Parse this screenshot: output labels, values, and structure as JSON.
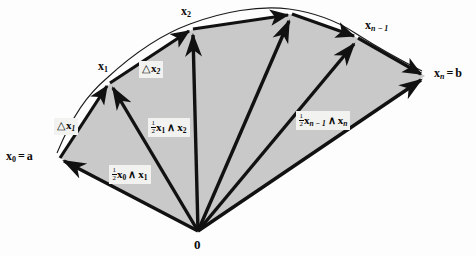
{
  "figure": {
    "name": "wedge-product-fan-diagram",
    "background_color": "#fdfdfd",
    "fill_color": "#c9c9c9",
    "stroke_color": "#111111",
    "curve_color": "#1a1a1a"
  },
  "labels": {
    "origin": "0",
    "start_point": {
      "vec": "x",
      "sub": "0",
      "eq": "=",
      "value": "a"
    },
    "end_point": {
      "vec": "x",
      "sub": "n",
      "eq": "=",
      "value": "b"
    },
    "x1": {
      "vec": "x",
      "sub": "1"
    },
    "x2": {
      "vec": "x",
      "sub": "2"
    },
    "xn1": {
      "vec": "x",
      "sub": "n − 1"
    }
  },
  "annotations": [
    {
      "name": "delta-x1",
      "triangle": "△",
      "vec": "x",
      "sub": "1",
      "text": "△x1"
    },
    {
      "name": "delta-x2",
      "triangle": "△",
      "vec": "x",
      "sub": "2",
      "text": "△x2"
    },
    {
      "name": "wedge-x0-x1",
      "numerator": "1",
      "denominator": "2",
      "vec_a": "x",
      "sub_a": "0",
      "wedge": "∧",
      "vec_b": "x",
      "sub_b": "1"
    },
    {
      "name": "wedge-x1-x2",
      "numerator": "1",
      "denominator": "2",
      "vec_a": "x",
      "sub_a": "1",
      "wedge": "∧",
      "vec_b": "x",
      "sub_b": "2"
    },
    {
      "name": "wedge-xn1-xn",
      "numerator": "1",
      "denominator": "2",
      "vec_a": "x",
      "sub_a": "n − 1",
      "wedge": "∧",
      "vec_b": "x",
      "sub_b": "n"
    }
  ],
  "geometry": {
    "origin": {
      "x": 198,
      "y": 231
    },
    "vertices": [
      {
        "name": "x0",
        "x": 60,
        "y": 158
      },
      {
        "name": "x1",
        "x": 110,
        "y": 83
      },
      {
        "name": "x2",
        "x": 193,
        "y": 29
      },
      {
        "name": "xi",
        "x": 292,
        "y": 14
      },
      {
        "name": "xn1",
        "x": 358,
        "y": 38
      },
      {
        "name": "xn",
        "x": 425,
        "y": 76
      }
    ]
  }
}
